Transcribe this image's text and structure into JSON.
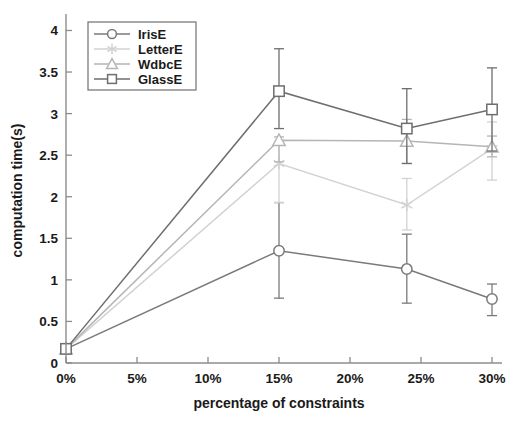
{
  "chart_data": {
    "type": "line",
    "title": "",
    "xlabel": "percentage of constraints",
    "ylabel": "computation time(s)",
    "x": [
      0,
      15,
      24,
      30
    ],
    "xtick_labels": [
      "0%",
      "5%",
      "10%",
      "15%",
      "20%",
      "25%",
      "30%"
    ],
    "xtick_values": [
      0,
      5,
      10,
      15,
      20,
      25,
      30
    ],
    "xlim": [
      0,
      30
    ],
    "ytick_labels": [
      "0",
      "0.5",
      "1",
      "1.5",
      "2",
      "2.5",
      "3",
      "3.5",
      "4"
    ],
    "ytick_values": [
      0,
      0.5,
      1,
      1.5,
      2,
      2.5,
      3,
      3.5,
      4
    ],
    "ylim": [
      0,
      4.15
    ],
    "grid": false,
    "legend_position": "top-left",
    "series": [
      {
        "name": "IrisE",
        "marker": "circle",
        "color": "#7a7a7a",
        "values": [
          0.17,
          1.35,
          1.13,
          0.77
        ],
        "err_low": [
          0.17,
          0.78,
          0.72,
          0.57
        ],
        "err_high": [
          0.2,
          1.93,
          1.55,
          0.95
        ]
      },
      {
        "name": "LetterE",
        "marker": "asterisk",
        "color": "#d2d2d2",
        "values": [
          0.17,
          2.4,
          1.9,
          2.58
        ],
        "err_low": [
          0.17,
          1.93,
          1.6,
          2.2
        ],
        "err_high": [
          0.2,
          2.62,
          2.22,
          2.9
        ]
      },
      {
        "name": "WdbcE",
        "marker": "triangle",
        "color": "#b5b5b5",
        "values": [
          0.17,
          2.68,
          2.67,
          2.6
        ],
        "err_low": [
          0.17,
          2.42,
          2.4,
          2.48
        ],
        "err_high": [
          0.2,
          2.72,
          2.93,
          2.73
        ]
      },
      {
        "name": "GlassE",
        "marker": "square",
        "color": "#6e6e6e",
        "values": [
          0.17,
          3.27,
          2.82,
          3.05
        ],
        "err_low": [
          0.17,
          2.82,
          2.4,
          2.55
        ],
        "err_high": [
          0.2,
          3.78,
          3.3,
          3.55
        ]
      }
    ]
  },
  "legend": {
    "entries": [
      "IrisE",
      "LetterE",
      "WdbcE",
      "GlassE"
    ]
  },
  "axes": {
    "x_title": "percentage of constraints",
    "y_title": "computation time(s)"
  }
}
